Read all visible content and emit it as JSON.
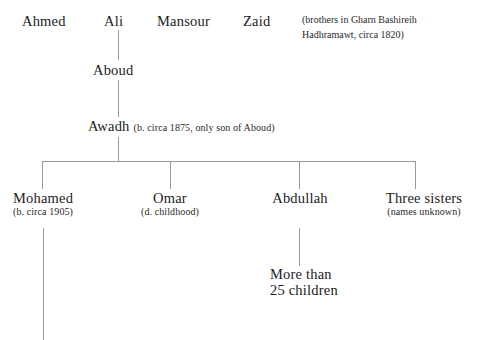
{
  "diagram": {
    "line_color": "#9a9a9a",
    "background": "#ffffff",
    "text_color": "#1c1c1c"
  },
  "generation1": {
    "label": "brothers generation",
    "people": [
      {
        "name": "Ahmed"
      },
      {
        "name": "Ali"
      },
      {
        "name": "Mansour"
      },
      {
        "name": "Zaid"
      }
    ],
    "annotation_line1": "(brothers in Gharn Bashireih",
    "annotation_line2": "Hadhramawt, circa 1820)"
  },
  "generation2": {
    "name": "Aboud"
  },
  "generation3": {
    "name": "Awadh",
    "detail": "(b. circa 1875, only son of  Aboud)"
  },
  "generation4": {
    "children": [
      {
        "name": "Mohamed",
        "detail": "(b. circa 1905)"
      },
      {
        "name": "Omar",
        "detail": "(d. childhood)"
      },
      {
        "name": "Abdullah",
        "detail": ""
      },
      {
        "name": "Three sisters",
        "detail": "(names unknown)"
      }
    ]
  },
  "generation5": {
    "abdullah_children_line1": "More than",
    "abdullah_children_line2": "25 children"
  }
}
